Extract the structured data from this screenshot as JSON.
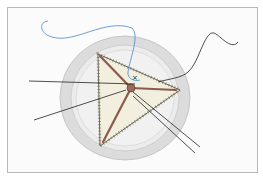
{
  "figure": {
    "type": "surgical-illustration",
    "colors": {
      "frame_border": "#b9b9b9",
      "ring_outer": "#dcdcdc",
      "ring_inner": "#e9e9e9",
      "annulus": "#efefef",
      "leaflet": "#f2efdf",
      "leaflet_edge": "#6e6a55",
      "commissure": "#8c5a4e",
      "suture_blue": "#4a86c8",
      "suture_black": "#222222"
    }
  }
}
